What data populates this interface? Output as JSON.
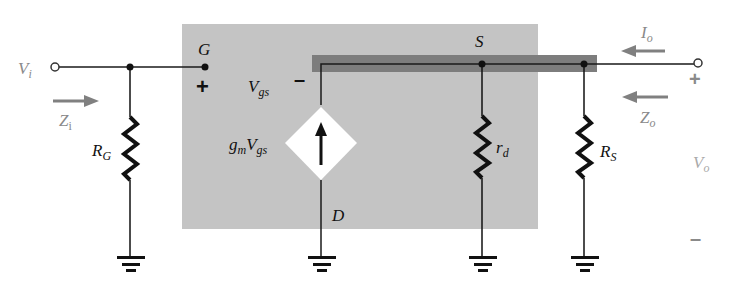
{
  "diagram": {
    "type": "FET small-signal equivalent circuit (source follower / common-drain)",
    "colors": {
      "background": "#ffffff",
      "fet_model_box": "#c4c4c4",
      "source_bar": "#7d7d7d",
      "wire": "#1a1a1a",
      "external_label": "#8a8a8a",
      "arrow": "#808080",
      "diamond_fill": "#ffffff"
    },
    "labels": {
      "input_voltage": {
        "main": "V",
        "sub": "i"
      },
      "input_impedance": {
        "main": "Z",
        "sub": "i"
      },
      "gate_node": "G",
      "gate_plus": "+",
      "vgs_minus": "–",
      "vgs": {
        "main": "V",
        "sub": "gs"
      },
      "dependent_source": {
        "gm": "g",
        "gm_sub": "m",
        "v": "V",
        "v_sub": "gs"
      },
      "source_node": "S",
      "drain_node": "D",
      "rg": {
        "main": "R",
        "sub": "G"
      },
      "rd": {
        "main": "r",
        "sub": "d"
      },
      "rs": {
        "main": "R",
        "sub": "S"
      },
      "output_current": {
        "main": "I",
        "sub": "o"
      },
      "output_impedance": {
        "main": "Z",
        "sub": "o"
      },
      "output_voltage": {
        "main": "V",
        "sub": "o"
      },
      "output_plus": "+",
      "output_minus": "–"
    },
    "components": [
      {
        "id": "RG",
        "kind": "resistor",
        "between": [
          "gate-input node",
          "ground"
        ]
      },
      {
        "id": "gmVgs",
        "kind": "dependent current source",
        "direction": "up",
        "between": [
          "D",
          "S"
        ]
      },
      {
        "id": "rd",
        "kind": "resistor",
        "between": [
          "S",
          "ground"
        ]
      },
      {
        "id": "RS",
        "kind": "resistor",
        "between": [
          "S",
          "ground"
        ]
      }
    ]
  }
}
